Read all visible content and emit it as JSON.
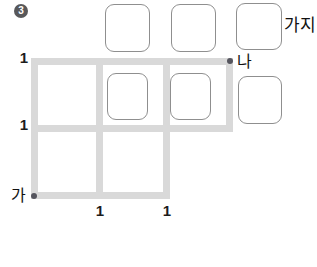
{
  "problem": {
    "number": "3"
  },
  "diagram": {
    "type": "grid-path-counting",
    "start_label": "가",
    "end_label": "나",
    "answer_unit_label": "가지",
    "edge_labels": {
      "left": [
        "1",
        "1"
      ],
      "bottom": [
        "1",
        "1"
      ]
    }
  },
  "colors": {
    "background": "#ffffff",
    "grid_line": "#d9d9d9",
    "answer_box_border": "#8f8f8f",
    "point_dot": "#55555e",
    "badge_background": "#58585a",
    "badge_text": "#ffffff",
    "label_text": "#1c1c1c"
  }
}
